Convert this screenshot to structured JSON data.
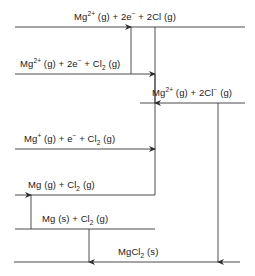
{
  "diagram": {
    "type": "energy-level-diagram",
    "canvas": {
      "width": 255,
      "height": 276
    },
    "line_color": "#4a4a4a",
    "text_color": "#1b1b1b",
    "levels": [
      {
        "id": "mg2plus-2e-2cl",
        "label_html": "Mg<sup>2+</sup> (g) + 2e<sup>−</sup> + 2Cl (g)",
        "label_text": "Mg2+ (g) + 2e- + 2Cl (g)",
        "y": 27,
        "x_start": 15,
        "x_end": 245
      },
      {
        "id": "mg2plus-2e-cl2",
        "label_html": "Mg<sup>2+</sup> (g) + 2e<sup>−</sup> + Cl<sub>2</sub> (g)",
        "label_text": "Mg2+ (g) + 2e- + Cl2 (g)",
        "y": 74,
        "x_start": 15,
        "x_end": 155
      },
      {
        "id": "mg2plus-2clminus",
        "label_html": "Mg<sup>2+</sup> (g) + 2Cl<sup>−</sup> (g)",
        "label_text": "Mg2+ (g) + 2Cl- (g)",
        "y": 103,
        "x_start": 140,
        "x_end": 245
      },
      {
        "id": "mgplus-e-cl2",
        "label_html": "Mg<sup>+</sup> (g) + e<sup>−</sup> + Cl<sub>2</sub> (g)",
        "label_text": "Mg+ (g) + e- + Cl2 (g)",
        "y": 149,
        "x_start": 15,
        "x_end": 155
      },
      {
        "id": "mg-g-cl2",
        "label_html": "Mg (g) + Cl<sub>2</sub> (g)",
        "label_text": "Mg (g) + Cl2 (g)",
        "y": 195,
        "x_start": 15,
        "x_end": 155
      },
      {
        "id": "mg-s-cl2",
        "label_html": "Mg (s) + Cl<sub>2</sub> (g)",
        "label_text": "Mg (s) + Cl2 (g)",
        "y": 229,
        "x_start": 15,
        "x_end": 155
      },
      {
        "id": "mgcl2-s",
        "label_html": "MgCl<sub>2</sub> (s)",
        "label_text": "MgCl2 (s)",
        "y": 262,
        "x_start": 14,
        "x_end": 240
      }
    ],
    "arrows": [
      {
        "id": "atomisation-chlorine",
        "x": 131,
        "y_from": 74,
        "y_to": 27,
        "direction": "up",
        "from_level": "mg2plus-2e-cl2",
        "to_level": "mg2plus-2e-2cl"
      },
      {
        "id": "electron-affinity",
        "x": 155,
        "y_from": 27,
        "y_to": 103,
        "direction": "down",
        "from_level": "mg2plus-2e-2cl",
        "to_level": "mg2plus-2clminus"
      },
      {
        "id": "second-ionisation-energy",
        "x": 155,
        "y_from": 149,
        "y_to": 74,
        "direction": "up",
        "from_level": "mgplus-e-cl2",
        "to_level": "mg2plus-2e-cl2"
      },
      {
        "id": "first-ionisation-energy",
        "x": 155,
        "y_from": 195,
        "y_to": 149,
        "direction": "up",
        "from_level": "mg-g-cl2",
        "to_level": "mgplus-e-cl2"
      },
      {
        "id": "atomisation-magnesium",
        "x": 31,
        "y_from": 229,
        "y_to": 195,
        "direction": "up",
        "from_level": "mg-s-cl2",
        "to_level": "mg-g-cl2"
      },
      {
        "id": "enthalpy-of-formation",
        "x": 89,
        "y_from": 229,
        "y_to": 262,
        "direction": "down",
        "from_level": "mg-s-cl2",
        "to_level": "mgcl2-s"
      },
      {
        "id": "lattice-enthalpy",
        "x": 218,
        "y_from": 103,
        "y_to": 262,
        "direction": "down",
        "from_level": "mg2plus-2clminus",
        "to_level": "mgcl2-s"
      }
    ]
  }
}
